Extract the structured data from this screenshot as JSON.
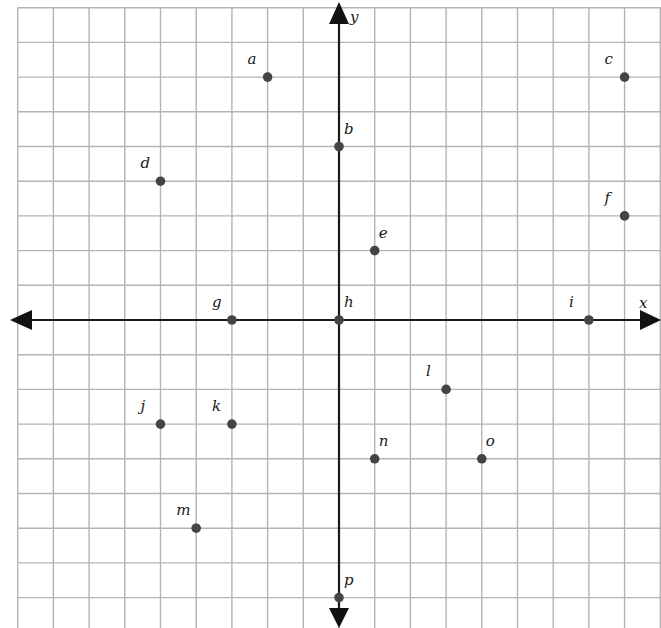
{
  "chart_data": {
    "type": "scatter",
    "title": "",
    "xlabel": "x",
    "ylabel": "y",
    "xlim": [
      -9,
      9
    ],
    "ylim": [
      -8.8,
      9
    ],
    "grid": true,
    "grid_step": 1,
    "legend": null,
    "points": [
      {
        "label": "a",
        "x": -2,
        "y": 7
      },
      {
        "label": "b",
        "x": 0,
        "y": 5
      },
      {
        "label": "c",
        "x": 8,
        "y": 7
      },
      {
        "label": "d",
        "x": -5,
        "y": 4
      },
      {
        "label": "e",
        "x": 1,
        "y": 2
      },
      {
        "label": "f",
        "x": 8,
        "y": 3
      },
      {
        "label": "g",
        "x": -3,
        "y": 0
      },
      {
        "label": "h",
        "x": 0,
        "y": 0
      },
      {
        "label": "i",
        "x": 7,
        "y": 0
      },
      {
        "label": "j",
        "x": -5,
        "y": -3
      },
      {
        "label": "k",
        "x": -3,
        "y": -3
      },
      {
        "label": "l",
        "x": 3,
        "y": -2
      },
      {
        "label": "m",
        "x": -4,
        "y": -6
      },
      {
        "label": "n",
        "x": 1,
        "y": -4
      },
      {
        "label": "o",
        "x": 4,
        "y": -4
      },
      {
        "label": "p",
        "x": 0,
        "y": -8
      }
    ]
  },
  "axes": {
    "x_label": "x",
    "y_label": "y"
  },
  "colors": {
    "grid": "#b4b4b4",
    "axis": "#1a1a1a",
    "point": "#444444",
    "background": "#ffffff"
  }
}
